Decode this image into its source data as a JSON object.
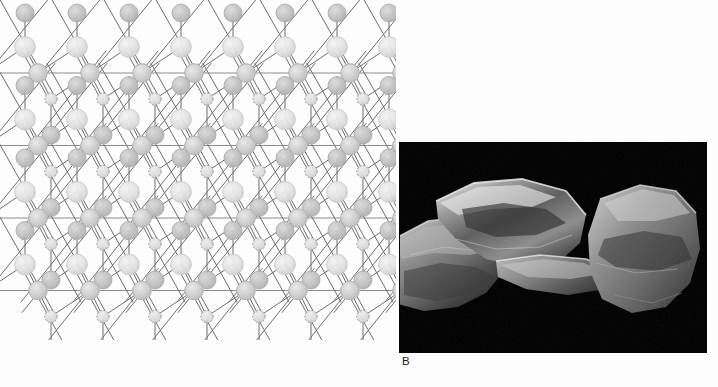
{
  "figure": {
    "panels": [
      {
        "id": "A",
        "label": "A",
        "kind": "diagram",
        "description": "Two-dimensional schematic of a phyllosilicate tetrahedral sheet: hexagonal rings of linked tetrahedra drawn as circles (atoms) joined by straight bond lines, with horizontal reference lines marking the basal oxygen planes."
      },
      {
        "id": "B",
        "label": "B",
        "kind": "micrograph",
        "description": "Grayscale scanning electron micrograph on a black background showing three overlapping platy mineral flakes with stepped cleavage edges and bright reflective basal surfaces."
      }
    ]
  },
  "chart_data": {
    "type": "diagram",
    "title": "",
    "subtitle": "",
    "xlabel": "",
    "ylabel": "",
    "grid": false,
    "legend_position": "none",
    "canvas": {
      "width": 396,
      "height": 340
    },
    "lattice": {
      "name": "phyllosilicate-tetrahedral-sheet",
      "horizontal_period": 104,
      "vertical_period": 145,
      "half_period": 52,
      "baseline_rows_y": [
        73,
        145.5,
        218,
        290.5
      ],
      "baseline_color": "#8c8c8c",
      "baseline_width": 1.1,
      "bond_color": "#6e6e6e",
      "bond_width": 1.0,
      "column_origins_x": [
        -14,
        38,
        90,
        142,
        194,
        246,
        298,
        350,
        402
      ],
      "atoms": {
        "basal_oxygen": {
          "role": "basal oxygen on reference line",
          "radius": 9.2,
          "fill": "#cfcfcf",
          "stroke": "#b4b4b4",
          "opacity": 0.95
        },
        "apical_oxygen": {
          "role": "apical oxygen at ring apex",
          "radius": 10.4,
          "fill": "#e2e2e2",
          "stroke": "#c6c6c6",
          "opacity": 0.95
        },
        "vertex_node": {
          "role": "node at diagonal X-crossing",
          "radius": 9.0,
          "fill": "#c2c2c2",
          "stroke": "#a8a8a8",
          "opacity": 0.95
        },
        "interlayer_cation": {
          "role": "small stippled cation site",
          "radius": 6.2,
          "fill": "#dcdcdc",
          "stroke": "#8f8f8f",
          "dash": "2,1.6",
          "opacity": 0.95
        }
      }
    }
  },
  "micrograph": {
    "background": "#000000",
    "flakes": [
      {
        "name": "flake-left",
        "tone_light": "#d8d8d8",
        "tone_mid": "#8a8a8a",
        "tone_dark": "#2a2a2a"
      },
      {
        "name": "flake-center",
        "tone_light": "#e6e6e6",
        "tone_mid": "#9a9a9a",
        "tone_dark": "#1e1e1e"
      },
      {
        "name": "flake-right",
        "tone_light": "#cccccc",
        "tone_mid": "#7e7e7e",
        "tone_dark": "#232323"
      }
    ]
  },
  "colors": {
    "page_background": "#ffffff",
    "panel_b_background": "#000000",
    "label_text": "#1a1a1a",
    "line_gray": "#6e6e6e",
    "baseline_gray": "#8c8c8c"
  }
}
